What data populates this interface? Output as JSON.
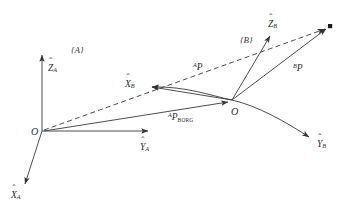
{
  "figure": {
    "type": "vector-diagram",
    "background_color": "#ffffff",
    "stroke_color": "#333333"
  },
  "frames": [
    {
      "id": "A",
      "label": "{A}",
      "origin_label": "O",
      "origin_px": [
        42,
        131
      ],
      "axes": [
        {
          "name": "z-axis-a",
          "base": "Z",
          "accent": "hat",
          "subscript": "A",
          "tip_px": [
            42,
            52
          ]
        },
        {
          "name": "y-axis-a",
          "base": "Y",
          "accent": "hat",
          "subscript": "A",
          "tip_px": [
            152,
            131
          ]
        },
        {
          "name": "x-axis-a",
          "base": "X",
          "accent": "hat",
          "subscript": "A",
          "tip_px": [
            22,
            188
          ]
        }
      ]
    },
    {
      "id": "B",
      "label": "{B}",
      "origin_label": "O",
      "origin_px": [
        232,
        100
      ],
      "axes": [
        {
          "name": "z-axis-b",
          "base": "Z",
          "accent": "hat",
          "subscript": "B",
          "tip_px": [
            272,
            32
          ]
        },
        {
          "name": "x-axis-b",
          "base": "X",
          "accent": "hat",
          "subscript": "B",
          "tip_px": [
            148,
            86
          ]
        },
        {
          "name": "y-axis-b",
          "base": "Y",
          "accent": "hat",
          "subscript": "B",
          "tip_px": [
            313,
            140
          ]
        }
      ]
    }
  ],
  "point": {
    "name": "target-point",
    "px": [
      330,
      26
    ],
    "marker": "filled-square"
  },
  "vectors": [
    {
      "name": "vector-ap",
      "superscript": "A",
      "base": "P",
      "style": "dashed",
      "from_px": [
        42,
        131
      ],
      "to_px": [
        330,
        26
      ],
      "label_px": [
        196,
        62
      ]
    },
    {
      "name": "vector-bp",
      "superscript": "B",
      "base": "P",
      "style": "solid",
      "from_px": [
        232,
        100
      ],
      "to_px": [
        330,
        26
      ],
      "label_px": [
        296,
        62
      ]
    },
    {
      "name": "vector-ap-borg",
      "superscript": "A",
      "base": "P",
      "subscript": "BORG",
      "style": "solid",
      "from_px": [
        42,
        131
      ],
      "to_px": [
        232,
        100
      ],
      "label_px": [
        168,
        113
      ]
    }
  ],
  "labels": {
    "frame_a": "{A}",
    "frame_b": "{B}",
    "origin_a": "O",
    "origin_b": "O",
    "z_a_base": "Z",
    "z_a_sub": "A",
    "y_a_base": "Y",
    "y_a_sub": "A",
    "x_a_base": "X",
    "x_a_sub": "A",
    "z_b_base": "Z",
    "z_b_sub": "B",
    "x_b_base": "X",
    "x_b_sub": "B",
    "y_b_base": "Y",
    "y_b_sub": "B",
    "ap_sup": "A",
    "ap_base": "P",
    "bp_sup": "B",
    "bp_base": "P",
    "aporg_sup": "A",
    "aporg_base": "P",
    "aporg_sub": "BORG",
    "hat": "ˆ"
  }
}
